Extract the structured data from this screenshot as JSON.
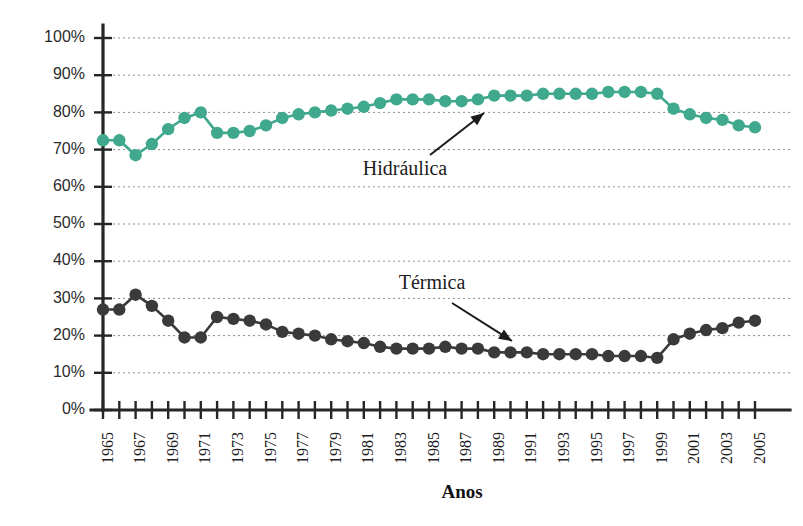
{
  "chart_data": {
    "type": "line",
    "title": "",
    "xlabel": "Anos",
    "ylabel": "",
    "ylim": [
      0,
      100
    ],
    "grid": true,
    "legend_position": "inline-annotations",
    "x": [
      1965,
      1966,
      1967,
      1968,
      1969,
      1970,
      1971,
      1972,
      1973,
      1974,
      1975,
      1976,
      1977,
      1978,
      1979,
      1980,
      1981,
      1982,
      1983,
      1984,
      1985,
      1986,
      1987,
      1988,
      1989,
      1990,
      1991,
      1992,
      1993,
      1994,
      1995,
      1996,
      1997,
      1998,
      1999,
      2000,
      2001,
      2002,
      2003,
      2004,
      2005
    ],
    "xtick_labels": [
      "1965",
      "1967",
      "1969",
      "1971",
      "1973",
      "1975",
      "1977",
      "1979",
      "1981",
      "1983",
      "1985",
      "1987",
      "1989",
      "1991",
      "1993",
      "1995",
      "1997",
      "1999",
      "2001",
      "2003",
      "2005"
    ],
    "ytick_labels": [
      "0%",
      "10%",
      "20%",
      "30%",
      "40%",
      "50%",
      "60%",
      "70%",
      "80%",
      "90%",
      "100%"
    ],
    "ytick_values": [
      0,
      10,
      20,
      30,
      40,
      50,
      60,
      70,
      80,
      90,
      100
    ],
    "series": [
      {
        "name": "Hidráulica",
        "color": "#3fa88d",
        "values": [
          72.5,
          72.5,
          68.5,
          71.5,
          75.5,
          78.5,
          80.0,
          74.5,
          74.5,
          75.0,
          76.5,
          78.5,
          79.5,
          80.0,
          80.5,
          81.0,
          81.5,
          82.5,
          83.5,
          83.5,
          83.5,
          83.0,
          83.0,
          83.5,
          84.5,
          84.5,
          84.5,
          85.0,
          85.0,
          85.0,
          85.0,
          85.5,
          85.5,
          85.5,
          85.0,
          81.0,
          79.5,
          78.5,
          78.0,
          76.5,
          76.0
        ]
      },
      {
        "name": "Térmica",
        "color": "#3a3a3a",
        "values": [
          27.0,
          27.0,
          31.0,
          28.0,
          24.0,
          19.5,
          19.5,
          25.0,
          24.5,
          24.0,
          23.0,
          21.0,
          20.5,
          20.0,
          19.0,
          18.5,
          18.0,
          17.0,
          16.5,
          16.5,
          16.5,
          17.0,
          16.5,
          16.5,
          15.5,
          15.5,
          15.5,
          15.0,
          15.0,
          15.0,
          15.0,
          14.5,
          14.5,
          14.5,
          14.0,
          19.0,
          20.5,
          21.5,
          22.0,
          23.5,
          24.0
        ]
      }
    ],
    "annotations": [
      {
        "text": "Hidráulica",
        "series": "Hidráulica"
      },
      {
        "text": "Térmica",
        "series": "Térmica"
      }
    ]
  }
}
